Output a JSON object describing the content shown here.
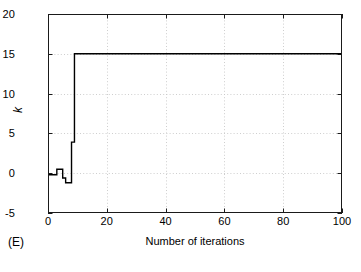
{
  "panel": {
    "caption": "(E)"
  },
  "chart_data": {
    "type": "line",
    "title": "",
    "subtitle": "",
    "xlabel": "Number of iterations",
    "ylabel": "k",
    "xlim": [
      0,
      100
    ],
    "ylim": [
      -5,
      20
    ],
    "xticks": [
      0,
      20,
      40,
      60,
      80,
      100
    ],
    "yticks": [
      -5,
      0,
      5,
      10,
      15,
      20
    ],
    "xtick_labels": [
      "0",
      "20",
      "40",
      "60",
      "80",
      "100"
    ],
    "ytick_labels": [
      "-5",
      "0",
      "5",
      "10",
      "15",
      "20"
    ],
    "grid": true,
    "grid_style": "dotted",
    "legend": null,
    "annotations": [],
    "series": [
      {
        "name": "k",
        "color": "#000000",
        "line_width": 1.4,
        "drawstyle": "steps-post",
        "x": [
          0,
          1,
          2,
          3,
          4,
          5,
          6,
          7,
          8,
          9,
          10,
          15,
          20,
          25,
          30,
          35,
          40,
          45,
          50,
          55,
          60,
          65,
          70,
          75,
          80,
          85,
          90,
          95,
          100
        ],
        "y": [
          -0.2,
          -0.2,
          -0.2,
          0.5,
          0.5,
          -0.6,
          -1.2,
          -1.2,
          3.9,
          15,
          15,
          15,
          15,
          15,
          15,
          15,
          15,
          15,
          15,
          15,
          15,
          15,
          15,
          15,
          15,
          15,
          15,
          15,
          15
        ]
      }
    ],
    "steady_state_value": 15,
    "convergence_iteration": 9
  }
}
